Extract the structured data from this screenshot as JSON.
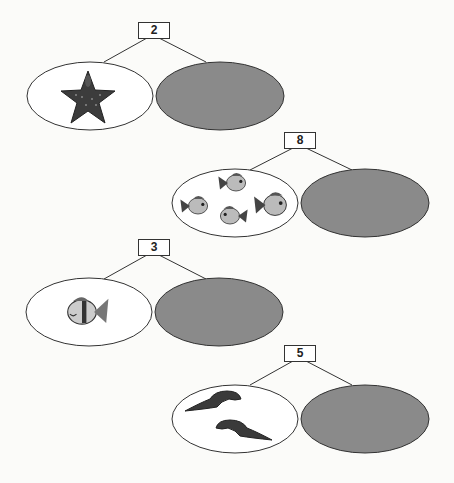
{
  "bonds": [
    {
      "whole": "2",
      "part_left": {
        "picture": "starfish",
        "count": 1
      },
      "part_right": {
        "blank": true
      }
    },
    {
      "whole": "8",
      "part_left": {
        "picture": "fish",
        "count": 4
      },
      "part_right": {
        "blank": true
      }
    },
    {
      "whole": "3",
      "part_left": {
        "picture": "fish",
        "count": 1
      },
      "part_right": {
        "blank": true
      }
    },
    {
      "whole": "5",
      "part_left": {
        "picture": "eel",
        "count": 2
      },
      "part_right": {
        "blank": true
      }
    }
  ],
  "colors": {
    "filled_ellipse": "#8a8a8a",
    "outline": "#333333",
    "background": "#fbfbf9"
  }
}
